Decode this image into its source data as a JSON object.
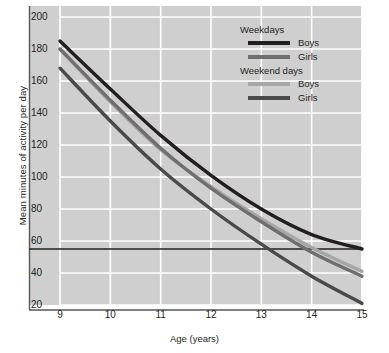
{
  "chart_data": {
    "type": "line",
    "title": "",
    "xlabel": "Age (years)",
    "ylabel": "Mean minutes of activity per day",
    "x": [
      9,
      10,
      11,
      12,
      13,
      14,
      15
    ],
    "xlim": [
      8.6,
      15.25
    ],
    "ylim": [
      14,
      206
    ],
    "xticks": [
      "9",
      "10",
      "11",
      "12",
      "13",
      "14",
      "15"
    ],
    "yticks": [
      "200",
      "180",
      "160",
      "140",
      "120",
      "100",
      "80",
      "60",
      "40",
      "20"
    ],
    "ytick_values": [
      200,
      180,
      160,
      140,
      120,
      100,
      80,
      60,
      40,
      20
    ],
    "grid": true,
    "grid_color": "#ffffff",
    "plot_background": "#cfcfcf",
    "legend_position": "top-right",
    "reference_line": {
      "label": "",
      "value": 55,
      "color": "#231f20",
      "orientation": "horizontal"
    },
    "series": [
      {
        "name": "Boys",
        "group": "Weekdays",
        "color": "#231f20",
        "width": 3.4,
        "values": [
          185,
          155,
          126,
          101,
          80,
          64,
          55
        ]
      },
      {
        "name": "Girls",
        "group": "Weekdays",
        "color": "#6f6f6f",
        "width": 3.4,
        "values": [
          180,
          148,
          118,
          93,
          72,
          53,
          38
        ]
      },
      {
        "name": "Boys",
        "group": "Weekend days",
        "color": "#a6a6a6",
        "width": 3.4,
        "values": [
          180,
          147,
          117,
          94,
          74,
          56,
          41
        ]
      },
      {
        "name": "Girls",
        "group": "Weekend days",
        "color": "#4a4a4a",
        "width": 3.4,
        "values": [
          168,
          135,
          105,
          80,
          58,
          38,
          21
        ]
      }
    ]
  },
  "legend": {
    "groups": [
      {
        "title": "Weekdays",
        "entries": [
          {
            "label": "Boys",
            "color": "#231f20"
          },
          {
            "label": "Girls",
            "color": "#6f6f6f"
          }
        ]
      },
      {
        "title": "Weekend days",
        "entries": [
          {
            "label": "Boys",
            "color": "#a6a6a6"
          },
          {
            "label": "Girls",
            "color": "#4a4a4a"
          }
        ]
      }
    ]
  }
}
